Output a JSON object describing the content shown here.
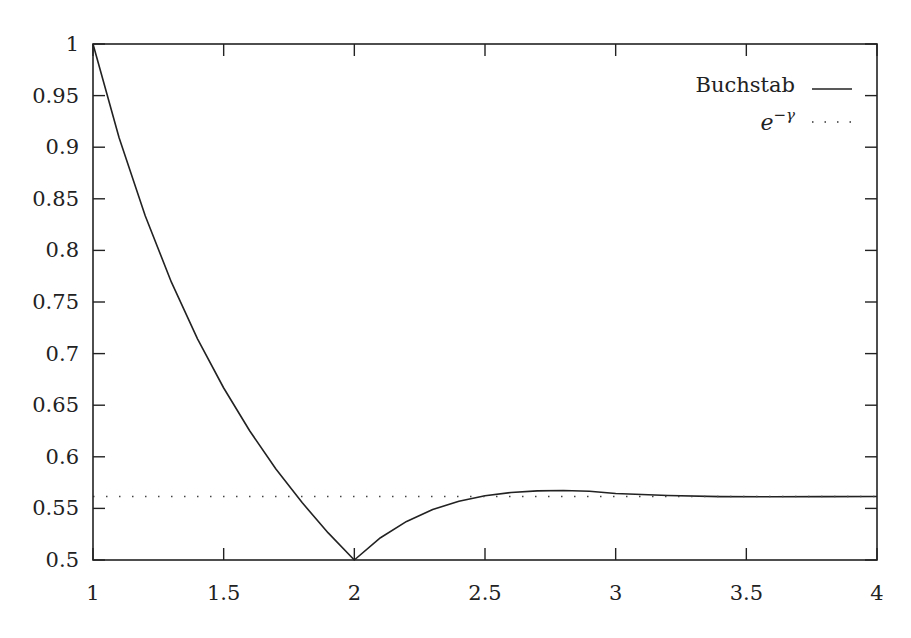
{
  "chart_data": {
    "type": "line",
    "title": "",
    "xlabel": "",
    "ylabel": "",
    "xlim": [
      1,
      4
    ],
    "ylim": [
      0.5,
      1
    ],
    "grid": false,
    "legend_position": "top-right",
    "x_ticks": [
      "1",
      "1.5",
      "2",
      "2.5",
      "3",
      "3.5",
      "4"
    ],
    "y_ticks": [
      "1",
      "0.95",
      "0.9",
      "0.85",
      "0.8",
      "0.75",
      "0.7",
      "0.65",
      "0.6",
      "0.55",
      "0.5"
    ],
    "series": [
      {
        "name": "Buchstab",
        "style": "solid",
        "x": [
          1.0,
          1.1,
          1.2,
          1.3,
          1.4,
          1.5,
          1.6,
          1.7,
          1.8,
          1.9,
          2.0,
          2.1,
          2.2,
          2.3,
          2.4,
          2.5,
          2.6,
          2.7,
          2.8,
          2.9,
          3.0,
          3.2,
          3.4,
          3.6,
          3.8,
          4.0
        ],
        "values": [
          1.0,
          0.9091,
          0.8333,
          0.7692,
          0.7143,
          0.6667,
          0.625,
          0.5882,
          0.5556,
          0.5263,
          0.5,
          0.5216,
          0.5374,
          0.5489,
          0.5569,
          0.5622,
          0.5654,
          0.567,
          0.5673,
          0.5666,
          0.5644,
          0.5625,
          0.5614,
          0.5613,
          0.5614,
          0.5615
        ]
      },
      {
        "name": "e^{-γ}",
        "style": "dotted",
        "x": [
          1,
          4
        ],
        "values": [
          0.5615,
          0.5615
        ]
      }
    ]
  },
  "legend": {
    "items": [
      {
        "label": "Buchstab",
        "style": "solid"
      },
      {
        "label_base": "e",
        "label_sup": "−γ",
        "style": "dotted"
      }
    ]
  }
}
